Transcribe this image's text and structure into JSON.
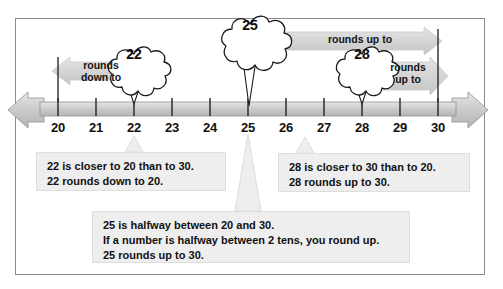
{
  "figure": {
    "type": "number-line-rounding-diagram",
    "frame_border_color": "#8c8c8c",
    "band_color": "#d7d7d7",
    "line_color": "#bfbfbf"
  },
  "number_line": {
    "min": 20,
    "max": 30,
    "step": 1,
    "ticks": [
      {
        "value": "20",
        "x": 58
      },
      {
        "value": "21",
        "x": 96
      },
      {
        "value": "22",
        "x": 134
      },
      {
        "value": "23",
        "x": 172
      },
      {
        "value": "24",
        "x": 210
      },
      {
        "value": "25",
        "x": 248
      },
      {
        "value": "26",
        "x": 286
      },
      {
        "value": "27",
        "x": 324
      },
      {
        "value": "28",
        "x": 362
      },
      {
        "value": "29",
        "x": 400
      },
      {
        "value": "30",
        "x": 438
      }
    ],
    "benchmark_lines": [
      "20",
      "30"
    ]
  },
  "bands": [
    {
      "id": "rounds-down-band",
      "label": "rounds\ndown to",
      "direction": "left",
      "from_value": "22",
      "to_value": "20"
    },
    {
      "id": "rounds-up-band-25",
      "label": "rounds up to",
      "direction": "right",
      "from_value": "25",
      "to_value": "30"
    },
    {
      "id": "rounds-up-band-28",
      "label": "rounds\nup to",
      "direction": "right",
      "from_value": "28",
      "to_value": "30"
    }
  ],
  "bursts": [
    {
      "id": "burst-22",
      "number": "22",
      "points_to": "22"
    },
    {
      "id": "burst-25",
      "number": "25",
      "points_to": "25"
    },
    {
      "id": "burst-28",
      "number": "28",
      "points_to": "28"
    }
  ],
  "explanations": [
    {
      "id": "explanation-22",
      "lines": [
        "22 is closer to 20 than to 30.",
        "22 rounds down to 20."
      ]
    },
    {
      "id": "explanation-28",
      "lines": [
        "28 is closer to 30 than to 20.",
        "28 rounds up to 30."
      ]
    },
    {
      "id": "explanation-25",
      "lines": [
        "25 is halfway between 20 and 30.",
        "If a number is halfway between 2 tens, you round up.",
        "25 rounds up to 30."
      ]
    }
  ]
}
